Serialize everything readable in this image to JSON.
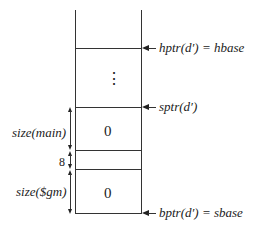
{
  "diagram": {
    "pointers": {
      "hptr": "hptr(d′) = hbase",
      "sptr": "sptr(d′)",
      "bptr": "bptr(d′) = sbase"
    },
    "cells": {
      "main_value": "0",
      "gm_value": "0"
    },
    "ellipsis": "⋮",
    "dimensions": {
      "main": "size(main)",
      "gap": "8",
      "gm": "size($gm)"
    }
  }
}
